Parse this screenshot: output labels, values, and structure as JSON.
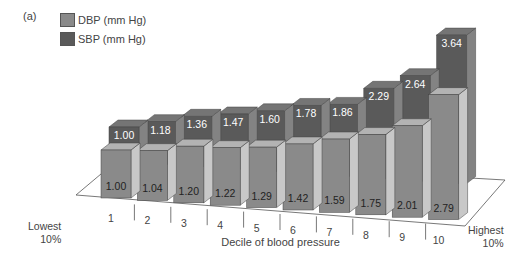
{
  "panel_label": "(a)",
  "legend": [
    {
      "label": "DBP (mm Hg)",
      "color": "#8a8a8a"
    },
    {
      "label": "SBP (mm Hg)",
      "color": "#5a5a5a"
    }
  ],
  "xlabel": "Decile of blood pressure",
  "lowest_label": [
    "Lowest",
    "10%"
  ],
  "highest_label": [
    "Highest",
    "10%"
  ],
  "chart_data": {
    "type": "bar",
    "title": "",
    "xlabel": "Decile of blood pressure",
    "ylabel": "",
    "categories": [
      "1",
      "2",
      "3",
      "4",
      "5",
      "6",
      "7",
      "8",
      "9",
      "10"
    ],
    "category_extremes": {
      "first": "Lowest 10%",
      "last": "Highest 10%"
    },
    "series": [
      {
        "name": "DBP (mm Hg)",
        "values": [
          1.0,
          1.04,
          1.2,
          1.22,
          1.29,
          1.42,
          1.59,
          1.75,
          2.01,
          2.79
        ],
        "color": "#8a8a8a"
      },
      {
        "name": "SBP (mm Hg)",
        "values": [
          1.0,
          1.18,
          1.36,
          1.47,
          1.6,
          1.78,
          1.86,
          2.29,
          2.64,
          3.64
        ],
        "color": "#5a5a5a"
      }
    ],
    "style": "3d-clustered",
    "data_labels": true,
    "grid": false,
    "legend_position": "top-left"
  }
}
